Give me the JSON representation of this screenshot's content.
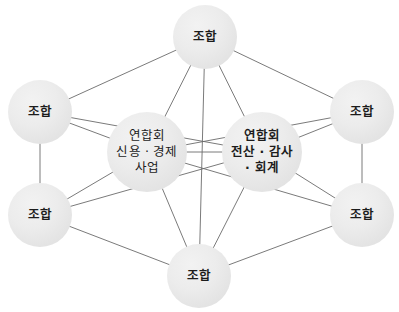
{
  "diagram": {
    "type": "network-hub-diagram",
    "background_color": "#ffffff",
    "node_fill_color": "#e8e8e8",
    "edge_color": "#6b6b6b",
    "text_color": "#1c1c1c",
    "nodes": [
      {
        "id": "top",
        "role": "member",
        "label": "조합",
        "cx": 205,
        "cy": 37,
        "r": 32
      },
      {
        "id": "upper-left",
        "role": "member",
        "label": "조합",
        "cx": 40,
        "cy": 112,
        "r": 32
      },
      {
        "id": "upper-right",
        "role": "member",
        "label": "조합",
        "cx": 362,
        "cy": 112,
        "r": 32
      },
      {
        "id": "lower-left",
        "role": "member",
        "label": "조합",
        "cx": 40,
        "cy": 215,
        "r": 32
      },
      {
        "id": "lower-right",
        "role": "member",
        "label": "조합",
        "cx": 362,
        "cy": 215,
        "r": 32
      },
      {
        "id": "bottom",
        "role": "member",
        "label": "조합",
        "cx": 199,
        "cy": 276,
        "r": 32
      },
      {
        "id": "hub-left",
        "role": "federation",
        "label": "연합회\n신용 · 경제\n사업",
        "cx": 147,
        "cy": 152,
        "r": 40
      },
      {
        "id": "hub-right",
        "role": "federation",
        "label": "연합회\n전산 · 감사\n· 회계",
        "cx": 262,
        "cy": 152,
        "r": 40
      }
    ],
    "edges": [
      {
        "from": "top",
        "to": "upper-left"
      },
      {
        "from": "top",
        "to": "upper-right"
      },
      {
        "from": "top",
        "to": "hub-left"
      },
      {
        "from": "top",
        "to": "hub-right"
      },
      {
        "from": "top",
        "to": "bottom"
      },
      {
        "from": "upper-left",
        "to": "lower-left"
      },
      {
        "from": "upper-left",
        "to": "hub-left"
      },
      {
        "from": "upper-left",
        "to": "hub-right"
      },
      {
        "from": "upper-right",
        "to": "lower-right"
      },
      {
        "from": "upper-right",
        "to": "hub-right"
      },
      {
        "from": "upper-right",
        "to": "hub-left"
      },
      {
        "from": "lower-left",
        "to": "bottom"
      },
      {
        "from": "lower-left",
        "to": "hub-left"
      },
      {
        "from": "lower-left",
        "to": "hub-right"
      },
      {
        "from": "lower-right",
        "to": "bottom"
      },
      {
        "from": "lower-right",
        "to": "hub-right"
      },
      {
        "from": "lower-right",
        "to": "hub-left"
      },
      {
        "from": "bottom",
        "to": "hub-left"
      },
      {
        "from": "bottom",
        "to": "hub-right"
      },
      {
        "from": "hub-left",
        "to": "hub-right"
      }
    ]
  }
}
